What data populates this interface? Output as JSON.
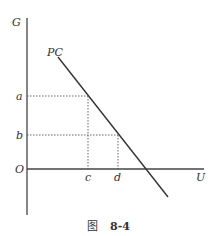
{
  "diagram": {
    "type": "line-diagram",
    "axes": {
      "y_label": "G",
      "x_label": "U",
      "origin_label": "O"
    },
    "curve": {
      "label": "PC",
      "description": "downward sloping straight line"
    },
    "y_ticks": [
      "a",
      "b"
    ],
    "x_ticks": [
      "c",
      "d"
    ],
    "guides": [
      {
        "from": "a",
        "to": "c"
      },
      {
        "from": "b",
        "to": "d"
      }
    ]
  },
  "caption": {
    "prefix": "图",
    "number": "8-4"
  }
}
